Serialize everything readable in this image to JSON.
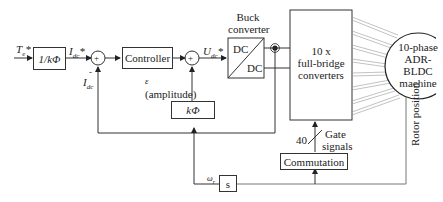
{
  "diagram": {
    "inputs": {
      "torque_ref": "T",
      "torque_ref_sub": "e",
      "torque_ref_sup": "*"
    },
    "blocks": {
      "inv_kphi": "1/kΦ",
      "controller": "Controller",
      "buck_title_line1": "Buck",
      "buck_title_line2": "converter",
      "buck_dc_top": "DC",
      "buck_dc_bottom": "DC",
      "full_bridge_line1": "10 x",
      "full_bridge_line2": "full-bridge",
      "full_bridge_line3": "converters",
      "machine_line1": "10-phase",
      "machine_line2": "ADR-",
      "machine_line3": "BLDC",
      "machine_line4": "machine",
      "kphi": "kΦ",
      "commutation": "Commutation",
      "derivative": "s"
    },
    "signals": {
      "idc_ref": "I",
      "idc_ref_sub": "dc",
      "idc_ref_sup": "*",
      "idc": "I",
      "idc_sub": "dc",
      "minus_sign": "-",
      "sum_plus": "+",
      "udc_ref": "U",
      "udc_ref_sub": "dc",
      "udc_ref_sup": "*",
      "epsilon": "ε",
      "amplitude": "(amplitude)",
      "gate_count": "40",
      "gate_line1": "Gate",
      "gate_line2": "signals",
      "rotor_position": "Rotor position",
      "omega": "ω",
      "omega_sub": "r"
    }
  }
}
